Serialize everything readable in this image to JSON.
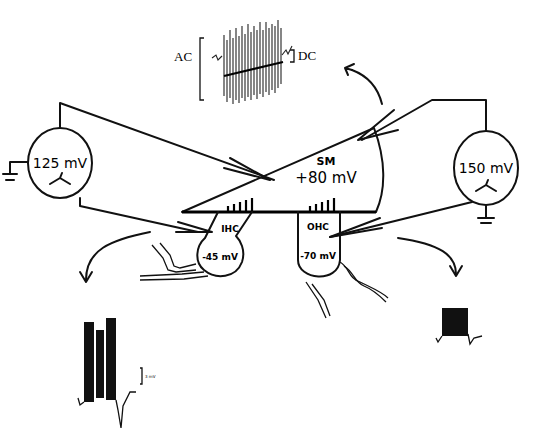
{
  "diagram": {
    "electrodes": [
      {
        "id": "left",
        "voltage": "125 mV"
      },
      {
        "id": "right",
        "voltage": "150 mV"
      }
    ],
    "scala_media": {
      "label": "SM",
      "potential": "+80 mV"
    },
    "cells": [
      {
        "label": "IHC",
        "potential": "-45 mV"
      },
      {
        "label": "OHC",
        "potential": "-70 mV"
      }
    ],
    "top_trace": {
      "left_label": "AC",
      "right_label": "DC"
    },
    "ihc_trace": {
      "scale_label": "3 mV"
    }
  }
}
